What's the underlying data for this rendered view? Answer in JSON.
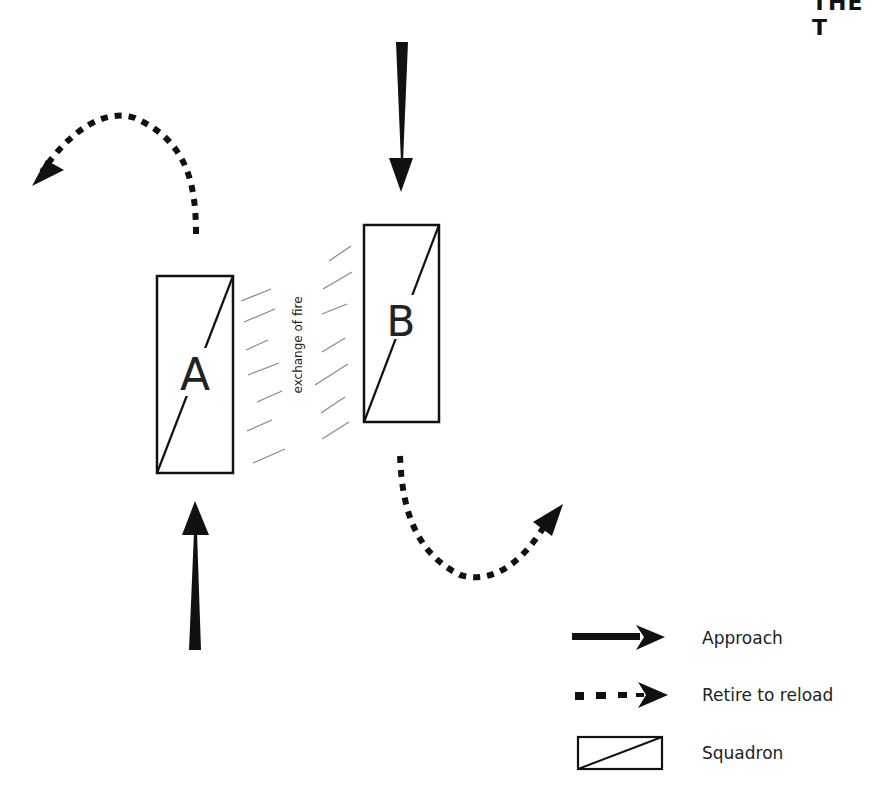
{
  "header": {
    "text": "THE T"
  },
  "diagram": {
    "squadrons": [
      {
        "id": "A",
        "label": "A"
      },
      {
        "id": "B",
        "label": "B"
      }
    ],
    "exchange_label": "exchange of fire"
  },
  "legend": {
    "items": [
      {
        "icon": "solid-arrow-icon",
        "label": "Approach"
      },
      {
        "icon": "dashed-arrow-icon",
        "label": "Retire to reload"
      },
      {
        "icon": "squadron-box-icon",
        "label": "Squadron"
      }
    ]
  },
  "colors": {
    "ink": "#111111",
    "hatch": "#888888",
    "background": "#ffffff"
  }
}
